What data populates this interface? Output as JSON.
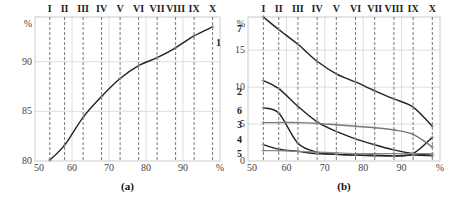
{
  "chart_data": [
    {
      "type": "line",
      "caption": "(a)",
      "title": "",
      "xlabel": "%",
      "ylabel": "%",
      "xlim": [
        50,
        100
      ],
      "ylim": [
        80,
        94.5
      ],
      "xticks": [
        "50",
        "60",
        "70",
        "80",
        "90",
        "%"
      ],
      "yticks": [
        "80",
        "85",
        "90",
        "%"
      ],
      "grid": true,
      "markers": [
        "I",
        "II",
        "III",
        "IV",
        "V",
        "VI",
        "VII",
        "VIII",
        "IX",
        "X"
      ],
      "x": [
        54,
        58,
        63,
        68,
        73,
        78,
        83,
        88,
        93,
        98
      ],
      "series": [
        {
          "name": "1",
          "color": "#222222",
          "values": [
            80.1,
            81.6,
            84.4,
            86.5,
            88.3,
            89.6,
            90.4,
            91.4,
            92.6,
            93.5
          ]
        }
      ]
    },
    {
      "type": "line",
      "caption": "(b)",
      "title": "",
      "xlabel": "%",
      "ylabel": "%",
      "xlim": [
        50,
        100
      ],
      "ylim": [
        0,
        19.5
      ],
      "xticks": [
        "50",
        "60",
        "70",
        "80",
        "90",
        "%"
      ],
      "yticks": [
        "0",
        "5",
        "10",
        "15",
        "%"
      ],
      "grid": true,
      "markers": [
        "I",
        "II",
        "III",
        "IV",
        "V",
        "VI",
        "VII",
        "VIII",
        "IX",
        "X"
      ],
      "x": [
        54,
        58,
        63,
        68,
        73,
        78,
        83,
        88,
        93,
        98
      ],
      "series": [
        {
          "name": "7",
          "color": "#222222",
          "values": [
            19.5,
            17.8,
            15.8,
            13.5,
            11.8,
            10.7,
            9.5,
            8.4,
            7.3,
            4.7
          ]
        },
        {
          "name": "2",
          "color": "#222222",
          "values": [
            10.9,
            9.8,
            7.4,
            5.3,
            4.0,
            3.0,
            2.2,
            1.5,
            1.0,
            0.8
          ]
        },
        {
          "name": "6",
          "color": "#222222",
          "values": [
            7.2,
            6.5,
            2.4,
            1.2,
            0.9,
            0.8,
            0.8,
            0.7,
            1.0,
            3.2
          ]
        },
        {
          "name": "3",
          "color": "#777777",
          "values": [
            5.2,
            5.2,
            5.2,
            5.1,
            4.9,
            4.7,
            4.5,
            4.2,
            3.6,
            1.9
          ]
        },
        {
          "name": "4",
          "color": "#222222",
          "values": [
            2.2,
            1.6,
            1.3,
            1.0,
            0.9,
            0.8,
            0.7,
            0.7,
            0.8,
            0.7
          ]
        },
        {
          "name": "5",
          "color": "#888888",
          "values": [
            1.4,
            1.4,
            1.3,
            1.2,
            1.1,
            1.0,
            1.0,
            1.0,
            1.0,
            1.0
          ]
        }
      ]
    }
  ]
}
